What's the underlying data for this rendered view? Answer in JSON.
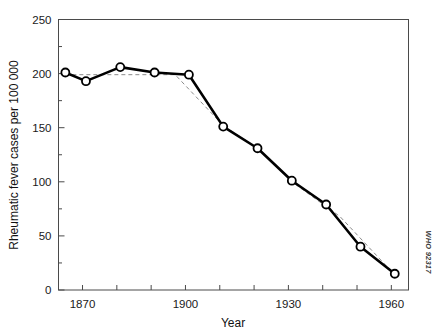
{
  "chart_data": {
    "type": "line",
    "title": "",
    "xlabel": "Year",
    "ylabel": "Rheumatic fever cases per 100 000",
    "xlim": [
      1863,
      1965
    ],
    "ylim": [
      0,
      250
    ],
    "grid": false,
    "legend": null,
    "x_ticks": [
      1870,
      1900,
      1930,
      1960
    ],
    "x_tick_labels": [
      "1870",
      "1900",
      "1930",
      "1960"
    ],
    "x_minor_ticks": [
      1870,
      1880,
      1890,
      1900,
      1910,
      1920,
      1930,
      1940,
      1950,
      1960
    ],
    "y_ticks": [
      0,
      50,
      100,
      150,
      200,
      250
    ],
    "y_tick_labels": [
      "0",
      "50",
      "100",
      "150",
      "200",
      "250"
    ],
    "y_minor_ticks": [
      25,
      75,
      125,
      175,
      225
    ],
    "series": [
      {
        "name": "Rheumatic fever cases per 100 000",
        "style": "solid-line-with-open-circle-markers",
        "x": [
          1865,
          1871,
          1881,
          1891,
          1901,
          1911,
          1921,
          1931,
          1941,
          1951,
          1961
        ],
        "values": [
          201,
          193,
          206,
          201,
          199,
          151,
          131,
          101,
          79,
          40,
          15
        ]
      },
      {
        "name": "trend",
        "style": "gray-dashed-trend-line",
        "x": [
          1865,
          1897,
          1911,
          1921,
          1931,
          1945,
          1961
        ],
        "values": [
          199,
          199,
          152,
          131,
          100,
          68,
          14
        ]
      }
    ],
    "annotations": [
      {
        "name": "who-credit",
        "text": "WHO 92317",
        "rotation": 90
      }
    ],
    "colors": {
      "series_line": "#000000",
      "marker_fill": "#ffffff",
      "marker_stroke": "#000000",
      "trend_line": "#8c8c8c",
      "axis": "#4a4a4a",
      "text": "#111111",
      "background": "#ffffff"
    }
  }
}
